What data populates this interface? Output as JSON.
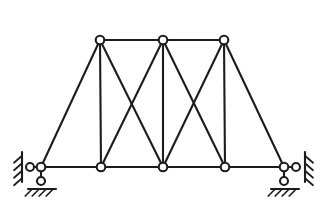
{
  "figure": {
    "kind": "truss-line-diagram",
    "background_color": "#ffffff",
    "line_color": "#1c1c1c",
    "joint_fill_color": "#ffffff",
    "canvas": {
      "width": 329,
      "height": 221
    }
  },
  "chart_data": {
    "type": "diagram",
    "xlabel": "",
    "ylabel": "",
    "xlim": [
      0,
      329
    ],
    "ylim": [
      0,
      221
    ],
    "grid": false,
    "legend": "none",
    "joints": [
      {
        "id": "L0",
        "label": "L0",
        "x": 41,
        "y": 167,
        "chord": "bottom"
      },
      {
        "id": "L1",
        "label": "L1",
        "x": 101,
        "y": 167,
        "chord": "bottom"
      },
      {
        "id": "L2",
        "label": "L2",
        "x": 163,
        "y": 167,
        "chord": "bottom"
      },
      {
        "id": "L3",
        "label": "L3",
        "x": 225,
        "y": 167,
        "chord": "bottom"
      },
      {
        "id": "L4",
        "label": "L4",
        "x": 284,
        "y": 167,
        "chord": "bottom"
      },
      {
        "id": "U1",
        "label": "U1",
        "x": 100,
        "y": 40,
        "chord": "top"
      },
      {
        "id": "U2",
        "label": "U2",
        "x": 163,
        "y": 40,
        "chord": "top"
      },
      {
        "id": "U3",
        "label": "U3",
        "x": 224,
        "y": 40,
        "chord": "top"
      },
      {
        "id": "RL",
        "label": "RL",
        "x": 30,
        "y": 167,
        "chord": "support"
      },
      {
        "id": "RR",
        "label": "RR",
        "x": 296,
        "y": 167,
        "chord": "support"
      },
      {
        "id": "PL",
        "label": "PL",
        "x": 41,
        "y": 181,
        "chord": "support"
      },
      {
        "id": "PR",
        "label": "PR",
        "x": 284,
        "y": 181,
        "chord": "support"
      }
    ],
    "members": [
      {
        "id": "M01",
        "name": "bottom-chord-L0-L1",
        "from": "L0",
        "to": "L1",
        "group": "bottom-chord"
      },
      {
        "id": "M02",
        "name": "bottom-chord-L1-L2",
        "from": "L1",
        "to": "L2",
        "group": "bottom-chord"
      },
      {
        "id": "M03",
        "name": "bottom-chord-L2-L3",
        "from": "L2",
        "to": "L3",
        "group": "bottom-chord"
      },
      {
        "id": "M04",
        "name": "bottom-chord-L3-L4",
        "from": "L3",
        "to": "L4",
        "group": "bottom-chord"
      },
      {
        "id": "M05",
        "name": "top-chord-U1-U2",
        "from": "U1",
        "to": "U2",
        "group": "top-chord"
      },
      {
        "id": "M06",
        "name": "top-chord-U2-U3",
        "from": "U2",
        "to": "U3",
        "group": "top-chord"
      },
      {
        "id": "M07",
        "name": "end-post-left",
        "from": "L0",
        "to": "U1",
        "group": "end-post"
      },
      {
        "id": "M08",
        "name": "end-post-right",
        "from": "L4",
        "to": "U3",
        "group": "end-post"
      },
      {
        "id": "M09",
        "name": "vertical-U1-L1",
        "from": "U1",
        "to": "L1",
        "group": "vertical"
      },
      {
        "id": "M10",
        "name": "vertical-U2-L2",
        "from": "U2",
        "to": "L2",
        "group": "vertical"
      },
      {
        "id": "M11",
        "name": "vertical-U3-L3",
        "from": "U3",
        "to": "L3",
        "group": "vertical"
      },
      {
        "id": "M12",
        "name": "diagonal-U1-L2",
        "from": "U1",
        "to": "L2",
        "group": "diagonal"
      },
      {
        "id": "M13",
        "name": "diagonal-U2-L1",
        "from": "U2",
        "to": "L1",
        "group": "diagonal"
      },
      {
        "id": "M14",
        "name": "diagonal-U2-L3",
        "from": "U2",
        "to": "L3",
        "group": "diagonal"
      },
      {
        "id": "M15",
        "name": "diagonal-U3-L2",
        "from": "U3",
        "to": "L2",
        "group": "diagonal"
      }
    ],
    "supports": [
      {
        "id": "SL-WALL",
        "name": "left-horizontal-roller-wall",
        "type": "roller-against-vertical-wall",
        "at_joint": "L0",
        "node_x": 30,
        "node_y": 167,
        "wall_x": 22,
        "wall_top": 152,
        "wall_bottom": 182,
        "hatch_side": "left",
        "hatch_count": 4
      },
      {
        "id": "SL-GROUND",
        "name": "left-vertical-roller-ground",
        "type": "roller-on-ground",
        "at_joint": "L0",
        "node_x": 41,
        "node_y": 181,
        "ground_y": 189,
        "ground_left": 28,
        "ground_right": 56,
        "hatch_side": "below",
        "hatch_count": 4
      },
      {
        "id": "SR-WALL",
        "name": "right-horizontal-roller-wall",
        "type": "roller-against-vertical-wall",
        "at_joint": "L4",
        "node_x": 296,
        "node_y": 167,
        "wall_x": 305,
        "wall_top": 152,
        "wall_bottom": 182,
        "hatch_side": "right",
        "hatch_count": 4
      },
      {
        "id": "SR-GROUND",
        "name": "right-vertical-roller-ground",
        "type": "roller-on-ground",
        "at_joint": "L4",
        "node_x": 284,
        "node_y": 181,
        "ground_y": 189,
        "ground_left": 271,
        "ground_right": 299,
        "hatch_side": "below",
        "hatch_count": 4
      }
    ],
    "annotations": [],
    "counts": {
      "joints": 8,
      "members": 15,
      "panels": 4,
      "x_braced_panels": 2
    }
  }
}
